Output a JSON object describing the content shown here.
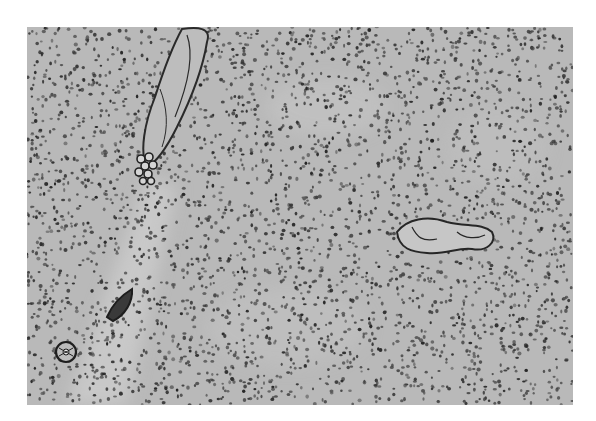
{
  "image": {
    "kind": "grayscale histology micrograph",
    "frame": {
      "x": 27,
      "y": 27,
      "width": 546,
      "height": 378
    },
    "colors": {
      "page_background": "#ffffff",
      "tissue_background": "#b9b9b9",
      "stroma_light": "#c8c8c8",
      "nucleus": "#3a3a3a",
      "vessel_wall": "#2a2a2a"
    },
    "features": [
      {
        "name": "elongated-vessel-upper-left",
        "description": "Long diagonal vessel with dark wall running from top edge down-left",
        "approx_bbox": [
          135,
          27,
          80,
          160
        ]
      },
      {
        "name": "vessel-cluster-left",
        "description": "Small cluster of ring-shaped cells at lower end of the long vessel",
        "approx_bbox": [
          133,
          150,
          30,
          40
        ]
      },
      {
        "name": "vessel-right",
        "description": "Horizontal irregular vessel cross-section at right-center",
        "approx_bbox": [
          393,
          218,
          100,
          38
        ]
      },
      {
        "name": "vessel-spindle-lower-left",
        "description": "Small spindle-shaped vessel, lower left",
        "approx_bbox": [
          106,
          290,
          28,
          30
        ]
      },
      {
        "name": "vessel-round-lower-left",
        "description": "Round vessel cross-section near bottom-left corner",
        "approx_bbox": [
          55,
          340,
          22,
          22
        ]
      },
      {
        "name": "pale-band-left",
        "description": "Lighter diagonal stromal band from vessel down to bottom-left",
        "approx_bbox": [
          60,
          180,
          110,
          200
        ]
      }
    ]
  }
}
